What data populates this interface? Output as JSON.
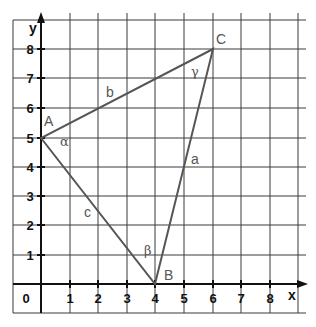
{
  "axes": {
    "x_label": "x",
    "y_label": "y",
    "origin_label": "0",
    "x_ticks": [
      "1",
      "2",
      "3",
      "4",
      "5",
      "6",
      "7",
      "8"
    ],
    "y_ticks": [
      "1",
      "2",
      "3",
      "4",
      "5",
      "6",
      "7",
      "8"
    ]
  },
  "triangle": {
    "vertices": [
      {
        "name": "A",
        "x": 0,
        "y": 5
      },
      {
        "name": "B",
        "x": 4,
        "y": 0
      },
      {
        "name": "C",
        "x": 6,
        "y": 8
      }
    ],
    "sides": [
      {
        "name": "a",
        "between": "B-C"
      },
      {
        "name": "b",
        "between": "A-C"
      },
      {
        "name": "c",
        "between": "A-B"
      }
    ],
    "angles": [
      {
        "name": "α",
        "at": "A"
      },
      {
        "name": "β",
        "at": "B"
      },
      {
        "name": "γ",
        "at": "C"
      }
    ]
  },
  "colors": {
    "grid": "#3a3a3a",
    "axis": "#111111",
    "triangle": "#555555",
    "background": "#ffffff"
  }
}
